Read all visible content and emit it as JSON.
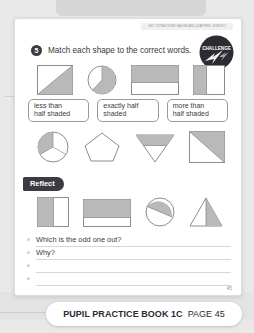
{
  "running_header": "UNIT 13 FRACTIONS: HALVES AND QUARTERS, LESSON 3",
  "question": {
    "number": "5",
    "text": "Match each shape to the correct words."
  },
  "challenge_badge": {
    "label": "CHALLENGE",
    "icon": "lightning-bolt-icon",
    "color": "#2b2b33"
  },
  "word_boxes": [
    {
      "line1": "less than",
      "line2": "half shaded"
    },
    {
      "line1": "exactly half",
      "line2": "shaded"
    },
    {
      "line1": "more than",
      "line2": "half shaded"
    }
  ],
  "reflect": {
    "label": "Reflect"
  },
  "answers": [
    {
      "prompt": "Which is the odd one out?"
    },
    {
      "prompt": "Why?"
    },
    {
      "prompt": ""
    },
    {
      "prompt": ""
    }
  ],
  "page_number": "45",
  "footer": {
    "book": "PUPIL PRACTICE BOOK 1C",
    "page": "PAGE 45"
  },
  "colors": {
    "shade": "#b9b9b9",
    "outline": "#8c8c8c",
    "ink": "#3a3a42",
    "paper": "#ffffff"
  },
  "shape_rows": [
    {
      "name": "shape-row-top",
      "shapes": [
        {
          "name": "square-diagonal-half-shaded",
          "type": "square-diagonal"
        },
        {
          "name": "circle-more-than-half-shaded",
          "type": "circle-major-sector"
        },
        {
          "name": "rectangle-top-band-shaded",
          "type": "rectangle-top-band"
        },
        {
          "name": "square-left-strip-shaded",
          "type": "square-left-strip"
        }
      ]
    },
    {
      "name": "shape-row-middle",
      "shapes": [
        {
          "name": "circle-thirds-one-shaded",
          "type": "circle-thirds"
        },
        {
          "name": "pentagon-unshaded",
          "type": "pentagon-outline"
        },
        {
          "name": "triangle-down-band-shaded",
          "type": "triangle-down-band"
        },
        {
          "name": "square-large-triangle-shaded",
          "type": "square-triangle-major"
        }
      ]
    },
    {
      "name": "shape-row-bottom",
      "shapes": [
        {
          "name": "square-left-half-shaded",
          "type": "square-left-half"
        },
        {
          "name": "rectangle-upper-band-shaded",
          "type": "rectangle-upper-band"
        },
        {
          "name": "circle-diagonal-segment-shaded",
          "type": "circle-segment"
        },
        {
          "name": "triangle-right-half-shaded",
          "type": "triangle-right-half"
        }
      ]
    }
  ]
}
